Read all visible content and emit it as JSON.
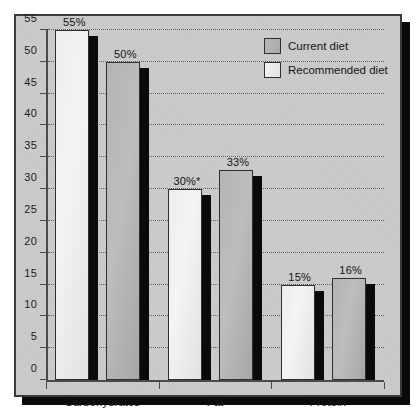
{
  "chart_data": {
    "type": "bar",
    "title": "",
    "xlabel": "",
    "ylabel": "",
    "ylim": [
      0,
      55
    ],
    "ytick_labels": [
      "0",
      "5",
      "10",
      "15",
      "20",
      "25",
      "30",
      "35",
      "40",
      "45",
      "50",
      "55"
    ],
    "ytick_values": [
      0,
      5,
      10,
      15,
      20,
      25,
      30,
      35,
      40,
      45,
      50,
      55
    ],
    "grid": true,
    "legend_position": "top-right",
    "categories": [
      "Carbohydrates",
      "Fat",
      "Protein"
    ],
    "series": [
      {
        "name": "Current diet",
        "values": [
          55,
          30,
          15
        ],
        "labels": [
          "55%",
          "30%*",
          "15%"
        ],
        "swatch": "light"
      },
      {
        "name": "Recommended diet",
        "values": [
          50,
          33,
          16
        ],
        "labels": [
          "50%",
          "33%",
          "16%"
        ],
        "swatch": "dark"
      }
    ],
    "annotations": [
      "*"
    ],
    "colors": {
      "panel": "#c9c9c9",
      "bar_light": "#eeeeee",
      "bar_dark": "#b4b4b4",
      "bar_shadow": "#0a0a0a",
      "axis": "#4a4a4a",
      "text": "#141414",
      "border": "#3a3a3a"
    }
  },
  "legend": {
    "items": [
      {
        "label": "Current diet"
      },
      {
        "label": "Recommended diet"
      }
    ]
  }
}
